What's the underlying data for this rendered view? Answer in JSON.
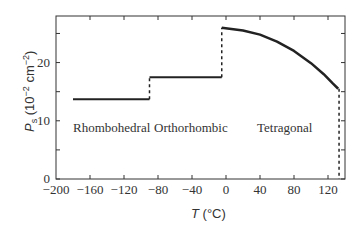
{
  "chart_data": {
    "type": "line",
    "title": "",
    "xlabel": "T (°C)",
    "ylabel": "Ps (10^-2 cm^-2)",
    "xlim": [
      -200,
      140
    ],
    "ylim": [
      0,
      28
    ],
    "xticks": [
      -200,
      -160,
      -120,
      -80,
      -40,
      0,
      40,
      80,
      120
    ],
    "yticks": [
      0,
      10,
      20
    ],
    "y_minor_ticks": [
      5,
      15,
      25
    ],
    "grid": false,
    "legend": "none",
    "phases": [
      {
        "name": "Rhombohedral",
        "t_range": [
          -180,
          -90
        ],
        "ps": [
          13.7,
          13.7
        ]
      },
      {
        "name": "Orthorhombic",
        "t_range": [
          -90,
          -5
        ],
        "ps": [
          17.5,
          17.5
        ]
      },
      {
        "name": "Tetragonal",
        "t_range": [
          -5,
          132
        ],
        "ps": [
          26.0,
          15.5
        ]
      }
    ],
    "series": [
      {
        "name": "Ps",
        "x": [
          -180,
          -90,
          -90,
          -5,
          -5,
          20,
          40,
          60,
          80,
          100,
          115,
          125,
          132,
          133
        ],
        "y": [
          13.7,
          13.7,
          17.5,
          17.5,
          26.0,
          25.5,
          24.8,
          23.6,
          22.0,
          19.9,
          18.0,
          16.5,
          15.5,
          0
        ],
        "transitions_dashed": [
          [
            -90,
            13.7,
            17.5
          ],
          [
            -5,
            17.5,
            26.0
          ],
          [
            133,
            15.5,
            0
          ]
        ]
      }
    ]
  },
  "labels": {
    "phase_rhombohedral": "Rhombohedral",
    "phase_orthorhombic": "Orthorhombic",
    "phase_tetragonal": "Tetragonal",
    "xlabel_T": "T",
    "xlabel_unit": " (°C)",
    "ylabel_P": "P",
    "ylabel_sub": "s",
    "ylabel_unit_open": " (10",
    "ylabel_exp1": "−2",
    "ylabel_cm": " cm",
    "ylabel_exp2": "−2",
    "ylabel_close": ")",
    "xtick_labels": [
      "−200",
      "−160",
      "−120",
      "−80",
      "−40",
      "0",
      "40",
      "80",
      "120"
    ],
    "ytick_labels": [
      "0",
      "10",
      "20"
    ]
  }
}
